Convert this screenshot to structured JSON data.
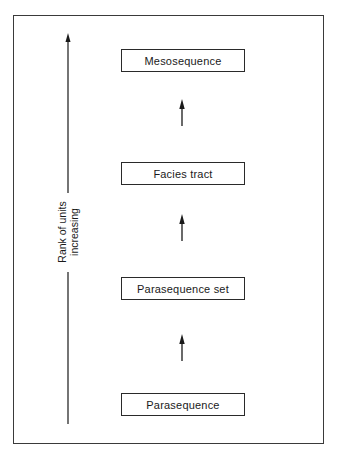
{
  "diagram": {
    "type": "hierarchy",
    "axis": {
      "label_line1": "Rank of units",
      "label_line2": "increasing",
      "direction": "up"
    },
    "units": [
      {
        "label": "Mesosequence",
        "rank": 4
      },
      {
        "label": "Facies tract",
        "rank": 3
      },
      {
        "label": "Parasequence set",
        "rank": 2
      },
      {
        "label": "Parasequence",
        "rank": 1
      }
    ],
    "colors": {
      "line": "#2a2a2a",
      "background": "#ffffff"
    }
  }
}
